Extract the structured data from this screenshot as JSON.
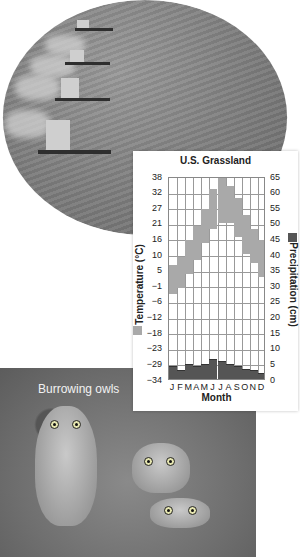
{
  "photos": {
    "top": {
      "subject": "combine harvesters in grain field"
    },
    "bottom": {
      "caption": "Burrowing owls"
    }
  },
  "chart_data": {
    "type": "bar",
    "title": "U.S. Grassland",
    "xlabel": "Month",
    "categories": [
      "J",
      "F",
      "M",
      "A",
      "M",
      "J",
      "J",
      "A",
      "S",
      "O",
      "N",
      "D"
    ],
    "ylabel_left": "Temperature (°C)",
    "ylabel_right": "Precipitation (cm)",
    "yticks_left": [
      "38",
      "32",
      "27",
      "21",
      "16",
      "10",
      "5",
      "−1",
      "−6",
      "−12",
      "−18",
      "−23",
      "−29",
      "−34"
    ],
    "yticks_right": [
      "65",
      "60",
      "55",
      "50",
      "45",
      "40",
      "35",
      "30",
      "25",
      "20",
      "15",
      "10",
      "5",
      "0"
    ],
    "ylim_left": [
      -34,
      38
    ],
    "ylim_right": [
      0,
      65
    ],
    "grid": true,
    "series": [
      {
        "name": "Temperature range (°C)",
        "color": "#a9a9a9",
        "axis": "left",
        "low": [
          -3,
          -1,
          4,
          9,
          15,
          20,
          22,
          22,
          17,
          11,
          8,
          3
        ],
        "high": [
          7,
          10,
          16,
          21,
          27,
          34,
          38,
          35,
          31,
          25,
          20,
          16
        ]
      },
      {
        "name": "Precipitation (cm)",
        "color": "#555555",
        "axis": "right",
        "values": [
          4,
          2.5,
          4.5,
          4,
          4.5,
          6,
          5.5,
          4.5,
          4,
          3,
          2.5,
          1.5
        ]
      }
    ],
    "legend": [
      {
        "label": "Temperature (°C)",
        "color": "#a9a9a9",
        "position": "left-axis"
      },
      {
        "label": "Precipitation (cm)",
        "color": "#555555",
        "position": "right-axis"
      }
    ]
  }
}
